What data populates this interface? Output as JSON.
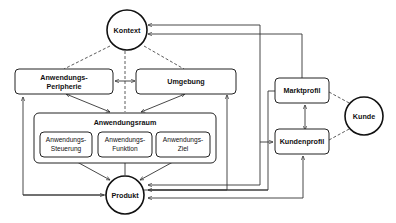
{
  "diagram": {
    "nodes": {
      "kontext": {
        "label": "Kontext",
        "shape": "circle"
      },
      "anwendungs_peripherie": {
        "label_line1": "Anwendungs-",
        "label_line2": "Peripherie",
        "shape": "rounded-rect"
      },
      "umgebung": {
        "label": "Umgebung",
        "shape": "rounded-rect"
      },
      "anwendungsraum": {
        "label": "Anwendungsraum",
        "shape": "rounded-rect-container"
      },
      "anwendungs_steuerung": {
        "label_line1": "Anwendungs-",
        "label_line2": "Steuerung",
        "shape": "rounded-rect"
      },
      "anwendungs_funktion": {
        "label_line1": "Anwendungs-",
        "label_line2": "Funktion",
        "shape": "rounded-rect"
      },
      "anwendungs_ziel": {
        "label_line1": "Anwendungs-",
        "label_line2": "Ziel",
        "shape": "rounded-rect"
      },
      "produkt": {
        "label": "Produkt",
        "shape": "circle"
      },
      "marktprofil": {
        "label": "Marktprofil",
        "shape": "rounded-rect"
      },
      "kundenprofil": {
        "label": "Kundenprofil",
        "shape": "rounded-rect"
      },
      "kunde": {
        "label": "Kunde",
        "shape": "circle"
      }
    },
    "edges": [
      {
        "from": "Kontext",
        "to": "Anwendungs-Peripherie",
        "style": "dashed"
      },
      {
        "from": "Kontext",
        "to": "Umgebung",
        "style": "dashed"
      },
      {
        "from": "Kontext",
        "to": "Anwendungsraum",
        "style": "dashed"
      },
      {
        "from": "Anwendungs-Peripherie",
        "to": "Umgebung",
        "style": "bidirectional"
      },
      {
        "from": "Anwendungs-Peripherie",
        "to": "Anwendungsraum",
        "style": "bidirectional"
      },
      {
        "from": "Umgebung",
        "to": "Anwendungsraum",
        "style": "bidirectional"
      },
      {
        "from": "Anwendungs-Steuerung",
        "to": "Produkt",
        "style": "bidirectional"
      },
      {
        "from": "Produkt",
        "to": "Anwendungs-Funktion",
        "style": "arrow"
      },
      {
        "from": "Produkt",
        "to": "Anwendungs-Ziel",
        "style": "bidirectional"
      },
      {
        "from": "Produkt",
        "to": "Anwendungs-Peripherie",
        "style": "arrow"
      },
      {
        "from": "Produkt",
        "to": "Umgebung",
        "style": "arrow"
      },
      {
        "from": "Produkt",
        "to": "Kontext",
        "style": "arrow"
      },
      {
        "from": "Marktprofil",
        "to": "Kontext",
        "style": "arrow"
      },
      {
        "from": "Marktprofil",
        "to": "Kundenprofil",
        "style": "bidirectional"
      },
      {
        "from": "Marktprofil",
        "to": "Produkt",
        "style": "arrow"
      },
      {
        "from": "Kundenprofil",
        "to": "Produkt",
        "style": "arrow"
      },
      {
        "from": "Produkt",
        "to": "Kundenprofil",
        "style": "arrow"
      },
      {
        "from": "Kunde",
        "to": "Marktprofil",
        "style": "dashed"
      },
      {
        "from": "Kunde",
        "to": "Kundenprofil",
        "style": "dashed"
      }
    ]
  }
}
